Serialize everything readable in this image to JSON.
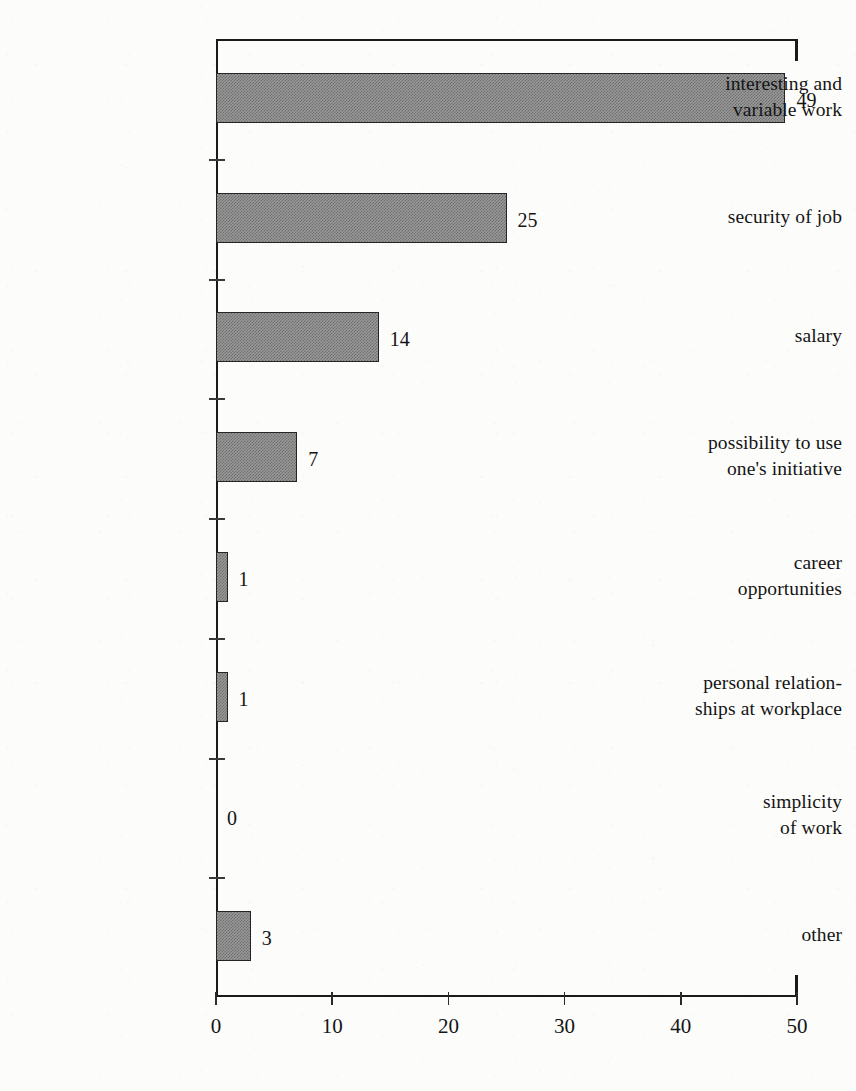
{
  "chart_data": {
    "type": "bar",
    "orientation": "horizontal",
    "title": "",
    "subtitle": "",
    "xlabel": "",
    "ylabel": "",
    "xlim": [
      0,
      50
    ],
    "ylim": null,
    "grid": false,
    "legend": null,
    "xticks": [
      "0",
      "10",
      "20",
      "30",
      "40",
      "50"
    ],
    "xtick_values": [
      0,
      10,
      20,
      30,
      40,
      50
    ],
    "categories": [
      "interesting and\nvariable work",
      "security of job",
      "salary",
      "possibility to use\none's initiative",
      "career\nopportunities",
      "personal relation-\nships at workplace",
      "simplicity\nof work",
      "other"
    ],
    "category_lines": [
      [
        "interesting and",
        "variable work"
      ],
      [
        "security of job"
      ],
      [
        "salary"
      ],
      [
        "possibility to use",
        "one's initiative"
      ],
      [
        "career",
        "opportunities"
      ],
      [
        "personal relation-",
        "ships at workplace"
      ],
      [
        "simplicity",
        "of work"
      ],
      [
        "other"
      ]
    ],
    "values": [
      49,
      25,
      14,
      7,
      1,
      1,
      0,
      3
    ],
    "data_labels": [
      "49",
      "25",
      "14",
      "7",
      "1",
      "1",
      "0",
      "3"
    ],
    "bar_fill": "#9a9a9a",
    "bar_pattern": "50% checkerboard dither",
    "bar_edge_color": "#252525",
    "axis_color": "#1a1a1a",
    "text_color": "#141414",
    "background": "#fcfcfb"
  }
}
